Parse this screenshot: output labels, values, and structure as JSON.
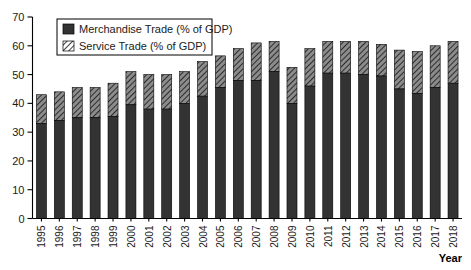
{
  "chart_data": {
    "type": "bar",
    "subtype": "stacked-vertical",
    "title": "",
    "xlabel": "Year",
    "ylabel": "",
    "ylim": [
      0,
      70
    ],
    "yticks": [
      0,
      10,
      20,
      30,
      40,
      50,
      60,
      70
    ],
    "grid": false,
    "legend_position": "top-left",
    "categories": [
      "1995",
      "1996",
      "1997",
      "1998",
      "1999",
      "2000",
      "2001",
      "2002",
      "2003",
      "2004",
      "2005",
      "2006",
      "2007",
      "2008",
      "2009",
      "2010",
      "2011",
      "2012",
      "2013",
      "2014",
      "2015",
      "2016",
      "2017",
      "2018"
    ],
    "series": [
      {
        "name": "Merchandise Trade (% of GDP)",
        "pattern": "solid",
        "color": "#333333",
        "values": [
          33.0,
          34.0,
          35.0,
          35.0,
          35.5,
          39.5,
          38.0,
          38.0,
          40.0,
          42.5,
          45.5,
          48.0,
          48.0,
          51.0,
          40.0,
          46.0,
          50.5,
          50.5,
          50.0,
          49.5,
          45.0,
          43.5,
          45.5,
          47.0
        ]
      },
      {
        "name": "Service Trade (% of GDP)",
        "pattern": "diagonal-hatch",
        "color": "#8c8c8c",
        "values": [
          10.0,
          10.0,
          10.5,
          10.5,
          11.5,
          11.5,
          12.0,
          12.0,
          11.0,
          12.0,
          11.0,
          11.0,
          13.0,
          10.5,
          12.5,
          13.0,
          11.0,
          11.0,
          11.5,
          11.0,
          13.5,
          14.5,
          14.5,
          14.5
        ]
      }
    ],
    "totals": [
      43.0,
      44.0,
      45.5,
      45.5,
      47.0,
      51.0,
      50.0,
      50.0,
      51.0,
      54.5,
      56.5,
      59.0,
      61.0,
      61.5,
      52.5,
      59.0,
      61.5,
      61.5,
      61.5,
      60.5,
      58.5,
      58.0,
      60.0,
      61.5
    ]
  },
  "legend": {
    "items": [
      {
        "label": "Merchandise Trade (% of GDP)"
      },
      {
        "label": "Service Trade (% of GDP)"
      }
    ]
  },
  "axis": {
    "x_title": "Year"
  }
}
